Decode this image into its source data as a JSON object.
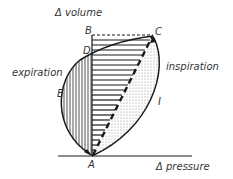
{
  "diagram": {
    "axes": {
      "y_label": "Δ volume",
      "x_label": "Δ pressure"
    },
    "points": {
      "A": "A",
      "B": "B",
      "C": "C",
      "D": "D",
      "E": "E",
      "I": "I"
    },
    "curves": {
      "expiration": "expiration",
      "inspiration": "inspiration"
    },
    "colors": {
      "line": "#1a1a1a",
      "stipple": "#9a9a9a",
      "background": "#ffffff"
    }
  }
}
